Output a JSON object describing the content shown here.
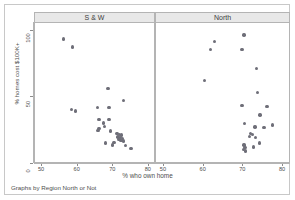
{
  "chart_data": {
    "type": "scatter",
    "title": "",
    "xlabel": "% who own home",
    "ylabel": "% homes cost $100K+",
    "caption": "Graphs by Region North or Not",
    "xlim": [
      48,
      82
    ],
    "ylim": [
      0,
      105
    ],
    "xticks": [
      50,
      60,
      70,
      80
    ],
    "xtick_labels": [
      "50",
      "60",
      "70",
      "80"
    ],
    "yticks": [
      0,
      50,
      100
    ],
    "ytick_labels": [
      "0",
      "50",
      "100"
    ],
    "grid": false,
    "legend": "none",
    "marker_color": "#6e6e78",
    "panel_header_color": "#e8e8e8",
    "frame_color": "#b4b4b4",
    "panels": [
      {
        "label": "S & W",
        "points": [
          {
            "x": 56.0,
            "y": 93.0
          },
          {
            "x": 58.5,
            "y": 87.0
          },
          {
            "x": 68.5,
            "y": 56.0
          },
          {
            "x": 72.8,
            "y": 47.0
          },
          {
            "x": 65.5,
            "y": 41.5
          },
          {
            "x": 68.8,
            "y": 41.5
          },
          {
            "x": 58.2,
            "y": 40.0
          },
          {
            "x": 59.3,
            "y": 39.0
          },
          {
            "x": 66.0,
            "y": 32.5
          },
          {
            "x": 68.8,
            "y": 32.5
          },
          {
            "x": 67.3,
            "y": 30.0
          },
          {
            "x": 67.5,
            "y": 27.5
          },
          {
            "x": 66.0,
            "y": 26.0
          },
          {
            "x": 65.7,
            "y": 24.5
          },
          {
            "x": 69.2,
            "y": 24.0
          },
          {
            "x": 71.0,
            "y": 22.0
          },
          {
            "x": 71.8,
            "y": 21.5
          },
          {
            "x": 72.3,
            "y": 21.0
          },
          {
            "x": 71.3,
            "y": 19.5
          },
          {
            "x": 72.0,
            "y": 19.0
          },
          {
            "x": 72.6,
            "y": 18.5
          },
          {
            "x": 71.6,
            "y": 17.5
          },
          {
            "x": 72.2,
            "y": 17.0
          },
          {
            "x": 72.9,
            "y": 16.5
          },
          {
            "x": 70.2,
            "y": 15.5
          },
          {
            "x": 67.8,
            "y": 15.0
          },
          {
            "x": 69.8,
            "y": 13.5
          },
          {
            "x": 73.4,
            "y": 13.0
          },
          {
            "x": 75.0,
            "y": 11.0
          }
        ]
      },
      {
        "label": "North",
        "points": [
          {
            "x": 70.2,
            "y": 96.0
          },
          {
            "x": 62.8,
            "y": 91.0
          },
          {
            "x": 61.8,
            "y": 85.0
          },
          {
            "x": 69.7,
            "y": 85.0
          },
          {
            "x": 73.3,
            "y": 71.0
          },
          {
            "x": 60.2,
            "y": 62.0
          },
          {
            "x": 73.5,
            "y": 53.0
          },
          {
            "x": 69.7,
            "y": 43.0
          },
          {
            "x": 76.0,
            "y": 42.5
          },
          {
            "x": 74.2,
            "y": 36.0
          },
          {
            "x": 70.3,
            "y": 29.5
          },
          {
            "x": 77.3,
            "y": 28.5
          },
          {
            "x": 72.9,
            "y": 27.0
          },
          {
            "x": 75.2,
            "y": 26.5
          },
          {
            "x": 71.8,
            "y": 22.0
          },
          {
            "x": 72.3,
            "y": 21.5
          },
          {
            "x": 71.5,
            "y": 20.0
          },
          {
            "x": 73.0,
            "y": 19.0
          },
          {
            "x": 74.0,
            "y": 15.0
          },
          {
            "x": 70.2,
            "y": 13.5
          },
          {
            "x": 70.4,
            "y": 11.5
          },
          {
            "x": 70.0,
            "y": 10.0
          },
          {
            "x": 70.5,
            "y": 9.0
          },
          {
            "x": 72.5,
            "y": 12.0
          }
        ]
      }
    ]
  }
}
